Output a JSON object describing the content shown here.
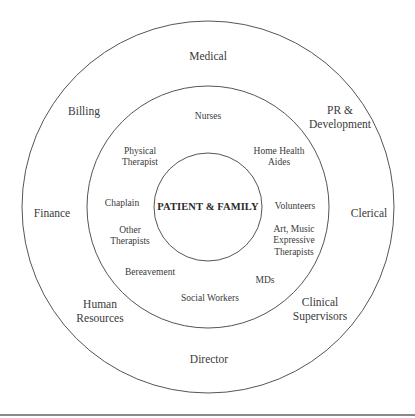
{
  "diagram": {
    "type": "concentric-circles",
    "colors": {
      "stroke": "#555555",
      "text": "#3a3a3a",
      "background": "#ffffff"
    },
    "circles": [
      {
        "name": "outer",
        "cx": 208,
        "cy": 207,
        "r": 186
      },
      {
        "name": "middle",
        "cx": 208,
        "cy": 207,
        "r": 121
      },
      {
        "name": "inner",
        "cx": 208,
        "cy": 207,
        "r": 54
      }
    ],
    "center_label": "PATIENT & FAMILY",
    "outer_ring": [
      {
        "id": "medical",
        "lines": [
          "Medical"
        ],
        "x": 208,
        "y": 57
      },
      {
        "id": "pr-development",
        "lines": [
          "PR &",
          "Development"
        ],
        "x": 340,
        "y": 118
      },
      {
        "id": "clerical",
        "lines": [
          "Clerical"
        ],
        "x": 369,
        "y": 214
      },
      {
        "id": "clinical-supervisors",
        "lines": [
          "Clinical",
          "Supervisors"
        ],
        "x": 320,
        "y": 310
      },
      {
        "id": "director",
        "lines": [
          "Director"
        ],
        "x": 209,
        "y": 360
      },
      {
        "id": "human-resources",
        "lines": [
          "Human",
          "Resources"
        ],
        "x": 100,
        "y": 312
      },
      {
        "id": "finance",
        "lines": [
          "Finance"
        ],
        "x": 52,
        "y": 214
      },
      {
        "id": "billing",
        "lines": [
          "Billing"
        ],
        "x": 84,
        "y": 112
      }
    ],
    "middle_ring": [
      {
        "id": "nurses",
        "lines": [
          "Nurses"
        ],
        "x": 208,
        "y": 117
      },
      {
        "id": "home-health-aides",
        "lines": [
          "Home Health",
          "Aides"
        ],
        "x": 279,
        "y": 157
      },
      {
        "id": "volunteers",
        "lines": [
          "Volunteers"
        ],
        "x": 295,
        "y": 207
      },
      {
        "id": "art-music-expressive-therapists",
        "lines": [
          "Art, Music",
          "Expressive",
          "Therapists"
        ],
        "x": 294,
        "y": 241
      },
      {
        "id": "mds",
        "lines": [
          "MDs"
        ],
        "x": 265,
        "y": 281
      },
      {
        "id": "social-workers",
        "lines": [
          "Social Workers"
        ],
        "x": 210,
        "y": 299
      },
      {
        "id": "bereavement",
        "lines": [
          "Bereavement"
        ],
        "x": 150,
        "y": 273
      },
      {
        "id": "other-therapists",
        "lines": [
          "Other",
          "Therapists"
        ],
        "x": 130,
        "y": 236
      },
      {
        "id": "chaplain",
        "lines": [
          "Chaplain"
        ],
        "x": 122,
        "y": 204
      },
      {
        "id": "physical-therapist",
        "lines": [
          "Physical",
          "Therapist"
        ],
        "x": 140,
        "y": 157
      }
    ]
  }
}
